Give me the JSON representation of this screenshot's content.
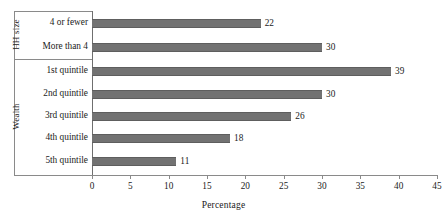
{
  "chart_data": {
    "type": "bar",
    "orientation": "horizontal",
    "title": "",
    "xlabel": "Percentage",
    "ylabel": "",
    "xlim": [
      0,
      45
    ],
    "xticks": [
      0,
      5,
      10,
      15,
      20,
      25,
      30,
      35,
      40,
      45
    ],
    "grid": false,
    "legend": null,
    "bar_color": "#727272",
    "axis_color": "#8a8a8a",
    "groups": [
      {
        "name": "HH size",
        "categories": [
          "4 or fewer",
          "More than 4"
        ],
        "values": [
          22,
          30
        ]
      },
      {
        "name": "Wealth",
        "categories": [
          "1st quintile",
          "2nd quintile",
          "3rd quintile",
          "4th quintile",
          "5th quintile"
        ],
        "values": [
          39,
          30,
          26,
          18,
          11
        ]
      }
    ],
    "categories": [
      "4 or fewer",
      "More than 4",
      "1st quintile",
      "2nd quintile",
      "3rd quintile",
      "4th quintile",
      "5th quintile"
    ],
    "values": [
      22,
      30,
      39,
      30,
      26,
      18,
      11
    ],
    "value_labels": [
      "22",
      "30",
      "39",
      "30",
      "26",
      "18",
      "11"
    ]
  }
}
